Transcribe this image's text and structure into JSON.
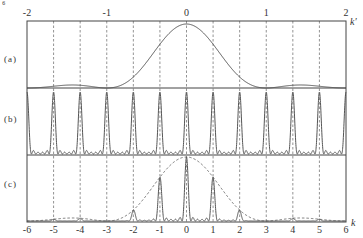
{
  "figure": {
    "corner_label": "⁶",
    "top_axis": {
      "name": "k′",
      "ticks": [
        "-2",
        "-1",
        "0",
        "1",
        "2"
      ],
      "values": [
        -2,
        -1,
        0,
        1,
        2
      ]
    },
    "bottom_axis": {
      "name": "k",
      "ticks": [
        "-6",
        "-5",
        "-4",
        "-3",
        "-2",
        "-1",
        "0",
        "1",
        "2",
        "3",
        "4",
        "5",
        "6"
      ],
      "values": [
        -6,
        -5,
        -4,
        -3,
        -2,
        -1,
        0,
        1,
        2,
        3,
        4,
        5,
        6
      ]
    },
    "panels": [
      {
        "id": "a",
        "label": "(a)",
        "description": "single-slit diffraction envelope (sinc squared) vs k'"
      },
      {
        "id": "b",
        "label": "(b)",
        "description": "multi-slit interference principal maxima at integer k with small secondary maxima"
      },
      {
        "id": "c",
        "label": "(c)",
        "description": "product: interference peaks modulated by dashed diffraction envelope"
      }
    ],
    "colors": {
      "line": "#555555",
      "frame": "#444444",
      "grid": "#777777",
      "text": "#333333",
      "background": "#ffffff"
    }
  },
  "chart_data": {
    "type": "line",
    "title": "",
    "panels": [
      "(a)",
      "(b)",
      "(c)"
    ],
    "x_top": {
      "label": "k'",
      "range": [
        -2,
        2
      ],
      "ticks": [
        -2,
        -1,
        0,
        1,
        2
      ]
    },
    "x_bottom": {
      "label": "k",
      "range": [
        -6,
        6
      ],
      "ticks": [
        -6,
        -5,
        -4,
        -3,
        -2,
        -1,
        0,
        1,
        2,
        3,
        4,
        5,
        6
      ]
    },
    "relation": "k' = k / 3",
    "grid": "vertical dashed lines at every integer k",
    "series": [
      {
        "name": "(a) diffraction envelope",
        "formula": "sinc^2(k')",
        "zeros_k": [
          -3,
          3
        ],
        "secondary_max_k": [
          -4.5,
          4.5
        ],
        "secondary_max_relative_height": 0.26
      },
      {
        "name": "(b) interference pattern",
        "principal_maxima_k": [
          -6,
          -5,
          -4,
          -3,
          -2,
          -1,
          0,
          1,
          2,
          3,
          4,
          5,
          6
        ],
        "principal_relative_height": 1.0,
        "secondary_maxima_between_peaks": 4
      },
      {
        "name": "(c) combined intensity",
        "peaks_k": [
          -5,
          -4,
          -2,
          -1,
          0,
          1,
          2,
          4,
          5
        ],
        "peak_relative_heights": [
          0.24,
          0.24,
          0.28,
          0.71,
          1.0,
          0.71,
          0.28,
          0.2,
          0.26
        ],
        "missing_orders_k": [
          -6,
          -3,
          3,
          6
        ],
        "envelope": "dashed sinc^2 curve from (a)"
      }
    ]
  }
}
